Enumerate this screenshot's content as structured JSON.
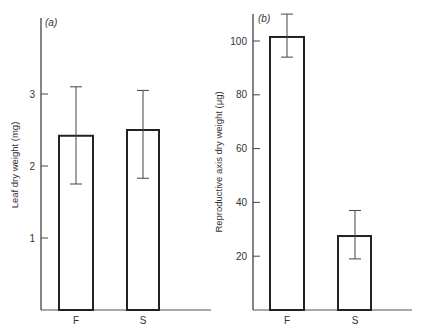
{
  "chart_data": [
    {
      "type": "bar",
      "panel_label": "(a)",
      "title": "",
      "xlabel": "",
      "ylabel": "Leaf dry weight (mg)",
      "categories": [
        "F",
        "S"
      ],
      "values": [
        2.42,
        2.5
      ],
      "error_bars": [
        {
          "low": 1.75,
          "high": 3.1
        },
        {
          "low": 1.83,
          "high": 3.05
        }
      ],
      "yticks": [
        1,
        2,
        3
      ],
      "ylim": [
        0,
        3.8
      ],
      "grid": false,
      "legend": null
    },
    {
      "type": "bar",
      "panel_label": "(b)",
      "title": "",
      "xlabel": "",
      "ylabel": "Reproductive axis dry weight (μg)",
      "categories": [
        "F",
        "S"
      ],
      "values": [
        101.5,
        27.5
      ],
      "error_bars": [
        {
          "low": 94,
          "high": 110
        },
        {
          "low": 19,
          "high": 37
        }
      ],
      "yticks": [
        20,
        40,
        60,
        80,
        100
      ],
      "ylim": [
        0,
        112
      ],
      "grid": false,
      "legend": null
    }
  ]
}
